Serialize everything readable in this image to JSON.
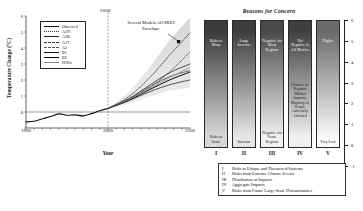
{
  "left_chart": {
    "y_axis_label": "Temperature Change (°C)",
    "x_axis_label": "Year",
    "y_ticks": [
      "6",
      "5",
      "4",
      "3",
      "2",
      "1",
      "0",
      "-1"
    ],
    "x_ticks": [
      "1900",
      "2000",
      "2100"
    ],
    "divider_label": "2000",
    "annotation": "Several Models All SRES Envelope",
    "legend": [
      {
        "label": "Observed",
        "color": "#111111",
        "style": "solid",
        "width": 1.1
      },
      {
        "label": "A1FI",
        "color": "#333333",
        "style": "dotted",
        "width": 0.8
      },
      {
        "label": "A1B",
        "color": "#222222",
        "style": "solid",
        "width": 0.8
      },
      {
        "label": "A1T",
        "color": "#333333",
        "style": "dashdot",
        "width": 0.8
      },
      {
        "label": "A2",
        "color": "#555555",
        "style": "dashed",
        "width": 0.8
      },
      {
        "label": "B1",
        "color": "#111111",
        "style": "solid",
        "width": 0.7
      },
      {
        "label": "B2",
        "color": "#000000",
        "style": "solid",
        "width": 1.0
      },
      {
        "label": "IS92a",
        "color": "#888888",
        "style": "solid",
        "width": 0.7
      }
    ]
  },
  "chart_data": {
    "type": "line",
    "title": "",
    "xlabel": "Year",
    "ylabel": "Temperature Change (°C)",
    "xlim": [
      1900,
      2100
    ],
    "ylim": [
      -1,
      6
    ],
    "grid": false,
    "legend_position": "top-left",
    "annotations": [
      {
        "text": "Several Models All SRES Envelope",
        "x": 2055,
        "y": 5.3
      },
      {
        "text": "2000",
        "x": 2000,
        "y": 6.4
      }
    ],
    "series": [
      {
        "name": "Observed",
        "x": [
          1900,
          1910,
          1920,
          1930,
          1940,
          1950,
          1960,
          1970,
          1980,
          1990,
          2000
        ],
        "values": [
          -0.62,
          -0.58,
          -0.42,
          -0.28,
          -0.12,
          -0.2,
          -0.18,
          -0.24,
          -0.1,
          0.08,
          0.22
        ]
      },
      {
        "name": "A1FI",
        "x": [
          2000,
          2025,
          2050,
          2075,
          2100
        ],
        "values": [
          0.22,
          0.95,
          2.1,
          3.55,
          4.95
        ]
      },
      {
        "name": "A1B",
        "x": [
          2000,
          2025,
          2050,
          2075,
          2100
        ],
        "values": [
          0.22,
          0.82,
          1.65,
          2.45,
          3.0
        ]
      },
      {
        "name": "A1T",
        "x": [
          2000,
          2025,
          2050,
          2075,
          2100
        ],
        "values": [
          0.22,
          0.8,
          1.55,
          2.2,
          2.6
        ]
      },
      {
        "name": "A2",
        "x": [
          2000,
          2025,
          2050,
          2075,
          2100
        ],
        "values": [
          0.22,
          0.78,
          1.5,
          2.5,
          3.75
        ]
      },
      {
        "name": "B1",
        "x": [
          2000,
          2025,
          2050,
          2075,
          2100
        ],
        "values": [
          0.22,
          0.7,
          1.25,
          1.7,
          2.0
        ]
      },
      {
        "name": "B2",
        "x": [
          2000,
          2025,
          2050,
          2075,
          2100
        ],
        "values": [
          0.22,
          0.72,
          1.38,
          2.0,
          2.5
        ]
      },
      {
        "name": "IS92a",
        "x": [
          2000,
          2025,
          2050,
          2075,
          2100
        ],
        "values": [
          0.22,
          0.75,
          1.45,
          2.15,
          2.8
        ]
      }
    ],
    "envelope": {
      "name": "All SRES Envelope",
      "x": [
        2000,
        2025,
        2050,
        2075,
        2100
      ],
      "upper": [
        0.25,
        1.25,
        2.75,
        4.45,
        5.9
      ],
      "lower": [
        0.2,
        0.5,
        0.95,
        1.35,
        1.5
      ]
    }
  },
  "embers": {
    "title": "Reasons for Concern",
    "y_ticks": [
      "6",
      "5",
      "4",
      "3",
      "2",
      "1",
      "0",
      "-1"
    ],
    "columns": [
      {
        "roman": "I",
        "top_text": "Risks to Many",
        "mid_text": "",
        "bottom_text": "Risks to Some",
        "top_color": "#3a3a3a",
        "bottom_color": "#d8d8d8"
      },
      {
        "roman": "II",
        "top_text": "Large Increase",
        "mid_text": "",
        "bottom_text": "Increase",
        "top_color": "#3d3d3d",
        "bottom_color": "#e6e6e6"
      },
      {
        "roman": "III",
        "top_text": "Negative for Most Regions",
        "mid_text": "",
        "bottom_text": "Negative for Some Regions",
        "top_color": "#4a4a4a",
        "bottom_color": "#f2f2f2"
      },
      {
        "roman": "IV",
        "top_text": "Net Negative in All Metrics",
        "mid_text": "Positive or Negative Market Impacts; Majority of People Adversely Affected",
        "bottom_text": "",
        "top_color": "#3f3f3f",
        "bottom_color": "#efefef"
      },
      {
        "roman": "V",
        "top_text": "Higher",
        "mid_text": "",
        "bottom_text": "Very Low",
        "top_color": "#6a6a6a",
        "bottom_color": "#fafafa"
      }
    ],
    "key": [
      {
        "num": "I",
        "text": "Risks to Unique and Threatened Systems"
      },
      {
        "num": "II",
        "text": "Risks from Extreme Climate Events"
      },
      {
        "num": "III",
        "text": "Distribution of Impacts"
      },
      {
        "num": "IV",
        "text": "Aggregate Impacts"
      },
      {
        "num": "V",
        "text": "Risks from Future Large-Scale Discontinuities"
      }
    ]
  }
}
